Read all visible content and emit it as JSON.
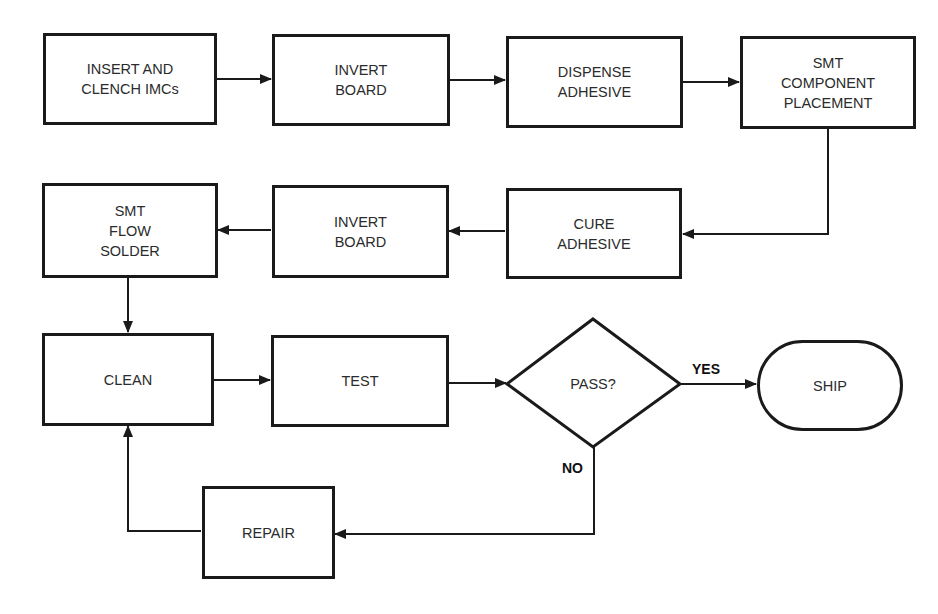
{
  "diagram": {
    "type": "flowchart",
    "nodes": [
      {
        "id": "n1",
        "shape": "rect",
        "label": "INSERT AND\nCLENCH IMCs"
      },
      {
        "id": "n2",
        "shape": "rect",
        "label": "INVERT\nBOARD"
      },
      {
        "id": "n3",
        "shape": "rect",
        "label": "DISPENSE\nADHESIVE"
      },
      {
        "id": "n4",
        "shape": "rect",
        "label": "SMT\nCOMPONENT\nPLACEMENT"
      },
      {
        "id": "n5",
        "shape": "rect",
        "label": "CURE\nADHESIVE"
      },
      {
        "id": "n6",
        "shape": "rect",
        "label": "INVERT\nBOARD"
      },
      {
        "id": "n7",
        "shape": "rect",
        "label": "SMT\nFLOW\nSOLDER"
      },
      {
        "id": "n8",
        "shape": "rect",
        "label": "CLEAN"
      },
      {
        "id": "n9",
        "shape": "rect",
        "label": "TEST"
      },
      {
        "id": "n10",
        "shape": "diamond",
        "label": "PASS?"
      },
      {
        "id": "n11",
        "shape": "stadium",
        "label": "SHIP"
      },
      {
        "id": "n12",
        "shape": "rect",
        "label": "REPAIR"
      }
    ],
    "edges": [
      {
        "from": "n1",
        "to": "n2",
        "label": ""
      },
      {
        "from": "n2",
        "to": "n3",
        "label": ""
      },
      {
        "from": "n3",
        "to": "n4",
        "label": ""
      },
      {
        "from": "n4",
        "to": "n5",
        "label": ""
      },
      {
        "from": "n5",
        "to": "n6",
        "label": ""
      },
      {
        "from": "n6",
        "to": "n7",
        "label": ""
      },
      {
        "from": "n7",
        "to": "n8",
        "label": ""
      },
      {
        "from": "n8",
        "to": "n9",
        "label": ""
      },
      {
        "from": "n9",
        "to": "n10",
        "label": ""
      },
      {
        "from": "n10",
        "to": "n11",
        "label": "YES"
      },
      {
        "from": "n10",
        "to": "n12",
        "label": "NO"
      },
      {
        "from": "n12",
        "to": "n8",
        "label": ""
      }
    ],
    "edge_labels": {
      "yes": "YES",
      "no": "NO"
    },
    "colors": {
      "stroke": "#1a1a1a",
      "text": "#2b2b2b",
      "background": "#ffffff"
    }
  }
}
